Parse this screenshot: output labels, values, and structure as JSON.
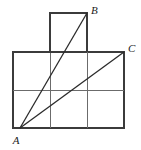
{
  "figure": {
    "canvas": {
      "width": 141,
      "height": 150,
      "background": "#ffffff"
    },
    "colors": {
      "outline": "#3b3b3b",
      "grid": "#6b6b6b",
      "segment": "#2b2b2b",
      "label": "#1c1c1c"
    },
    "labels": {
      "a": "A",
      "b": "B",
      "c": "C"
    },
    "points": {
      "a": {
        "name": "A",
        "x": 20,
        "y": 128,
        "label_x": 16,
        "label_y": 142
      },
      "b": {
        "name": "B",
        "x": 87,
        "y": 13,
        "label_x": 91,
        "label_y": 13
      },
      "c": {
        "name": "C",
        "x": 124,
        "y": 52,
        "label_x": 128,
        "label_y": 50
      }
    },
    "main_rect": {
      "x": 13,
      "y": 52,
      "width": 111,
      "height": 76
    },
    "top_square": {
      "x": 50,
      "y": 13,
      "width": 37,
      "height": 39
    },
    "grid_lines": [
      {
        "name": "vertical-col-1",
        "x1": 50,
        "y1": 52,
        "x2": 50,
        "y2": 128
      },
      {
        "name": "vertical-col-2",
        "x1": 87,
        "y1": 52,
        "x2": 87,
        "y2": 128
      },
      {
        "name": "horizontal-mid",
        "x1": 13,
        "y1": 90,
        "x2": 124,
        "y2": 90
      }
    ],
    "segments": [
      {
        "name": "segment-ab",
        "from": "A",
        "to": "B",
        "x1": 20,
        "y1": 128,
        "x2": 87,
        "y2": 13
      },
      {
        "name": "segment-ac",
        "from": "A",
        "to": "C",
        "x1": 20,
        "y1": 128,
        "x2": 124,
        "y2": 52
      }
    ]
  }
}
